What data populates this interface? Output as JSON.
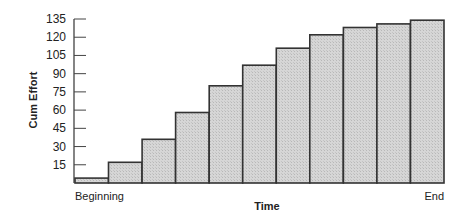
{
  "chart_data": {
    "type": "bar",
    "title": "",
    "xlabel": "Time",
    "ylabel": "Cum Effort",
    "x_start_label": "Beginning",
    "x_end_label": "End",
    "categories": [
      "1",
      "2",
      "3",
      "4",
      "5",
      "6",
      "7",
      "8",
      "9",
      "10",
      "11"
    ],
    "values": [
      4,
      17,
      36,
      58,
      80,
      97,
      111,
      122,
      128,
      131,
      134
    ],
    "yticks": [
      15,
      30,
      45,
      60,
      75,
      90,
      105,
      120,
      135
    ],
    "ylim": [
      0,
      135
    ],
    "grid": false,
    "legend": null,
    "bar_fill": "#d4d4d4",
    "bar_stroke": "#333333"
  }
}
